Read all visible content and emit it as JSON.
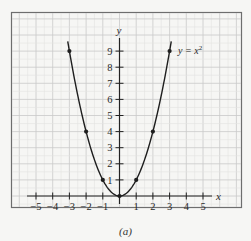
{
  "figure": {
    "caption": "(a)"
  },
  "chart_data": {
    "type": "line",
    "title": "",
    "function_label": "y = x",
    "function_label_exponent": "2",
    "xlabel": "x",
    "ylabel": "y",
    "xlim": [
      -5.5,
      5.5
    ],
    "ylim": [
      -1,
      10
    ],
    "grid": true,
    "x_ticks": [
      -5,
      -4,
      -3,
      -2,
      -1,
      1,
      2,
      3,
      4,
      5
    ],
    "x_tick_labels": [
      "−5",
      "−4",
      "−3",
      "−2",
      "−1",
      "1",
      "2",
      "3",
      "4",
      "5"
    ],
    "y_ticks": [
      1,
      2,
      3,
      4,
      5,
      6,
      7,
      8,
      9
    ],
    "y_tick_labels": [
      "1",
      "2",
      "3",
      "4",
      "5",
      "6",
      "7",
      "8",
      "9"
    ],
    "series": [
      {
        "name": "y = x^2",
        "curve_x_range": [
          -3.1,
          3.1
        ],
        "points": [
          {
            "x": -3,
            "y": 9
          },
          {
            "x": -2,
            "y": 4
          },
          {
            "x": -1,
            "y": 1
          },
          {
            "x": 0,
            "y": 0
          },
          {
            "x": 1,
            "y": 1
          },
          {
            "x": 2,
            "y": 4
          },
          {
            "x": 3,
            "y": 9
          }
        ]
      }
    ],
    "colors": {
      "curve": "#1e1e1e",
      "axis": "#222222",
      "grid": "#c9c9c9",
      "frame": "#6e6e6e",
      "background": "#f6f6f4"
    }
  }
}
